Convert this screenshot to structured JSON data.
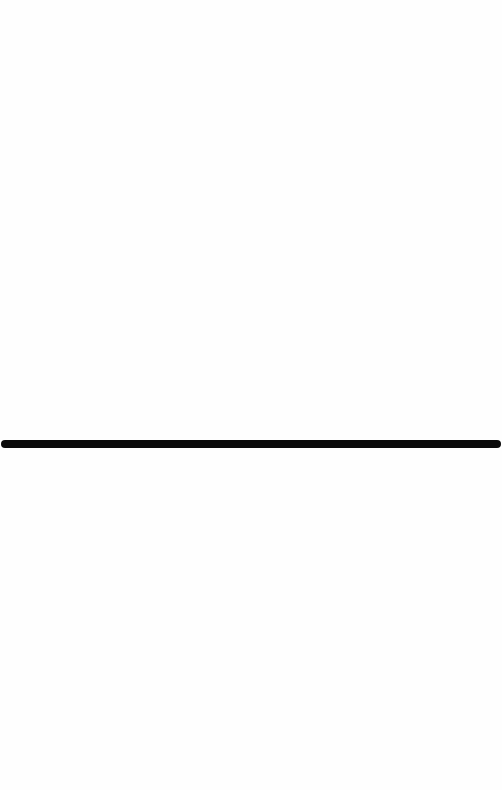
{
  "screen": {
    "background_color": "#ffffff"
  },
  "panes": {
    "top": {
      "content": ""
    },
    "bottom": {
      "content": ""
    }
  },
  "divider": {
    "color": "#0b0b0b",
    "orientation": "horizontal"
  }
}
